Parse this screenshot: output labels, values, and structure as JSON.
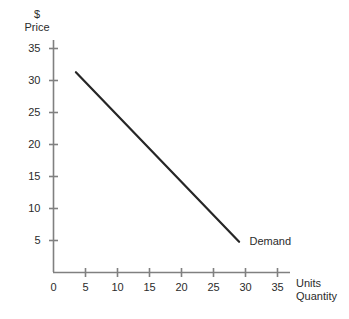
{
  "chart_data": {
    "type": "line",
    "title": "",
    "xlabel": "Units Quantity",
    "ylabel": "$ Price",
    "y_axis_unit": "$",
    "y_axis_name": "Price",
    "x_axis_unit": "Units",
    "x_axis_name": "Quantity",
    "xlim": [
      0,
      37.5
    ],
    "ylim": [
      0,
      37.5
    ],
    "grid": false,
    "legend_position": "inline-end-of-line",
    "xticks": [
      0,
      5,
      10,
      15,
      20,
      25,
      30,
      35
    ],
    "xtick_labels": [
      "0",
      "5",
      "10",
      "15",
      "20",
      "25",
      "30",
      "35"
    ],
    "yticks": [
      5,
      10,
      15,
      20,
      25,
      30,
      35
    ],
    "ytick_labels": [
      "5",
      "10",
      "15",
      "20",
      "25",
      "30",
      "35"
    ],
    "series": [
      {
        "name": "Demand",
        "label": "Demand",
        "color": "#262626",
        "x": [
          3.5,
          29.0
        ],
        "values": [
          31.3,
          4.8
        ]
      }
    ],
    "annotations": [
      {
        "text": "Demand",
        "x": 30.0,
        "y": 4.8
      }
    ],
    "colors": {
      "axis": "#808080",
      "series": "#262626",
      "text": "#2b2b2b",
      "background": "#ffffff"
    }
  }
}
